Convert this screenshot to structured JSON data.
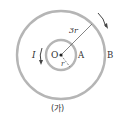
{
  "diagram": {
    "outer_radius_label": "3r",
    "inner_radius_label": "r",
    "center_label": "O",
    "inner_loop_label": "A",
    "outer_loop_label": "B",
    "current_label": "I",
    "caption": "(가)",
    "colors": {
      "ring": "#b5b5b5",
      "line": "#444444",
      "text": "#333333"
    }
  }
}
